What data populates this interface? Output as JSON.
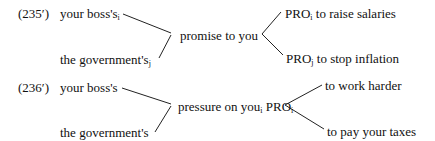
{
  "examples": [
    {
      "label": "(235′)",
      "left": [
        {
          "text": "your boss's",
          "sub": "i"
        },
        {
          "text": "the government's",
          "sub": "j"
        }
      ],
      "center": {
        "text": "promise to you",
        "sub": ""
      },
      "right": [
        {
          "pro": "PRO",
          "sub": "i",
          "text": " to raise salaries"
        },
        {
          "pro": "PRO",
          "sub": "j",
          "text": " to stop inflation"
        }
      ]
    },
    {
      "label": "(236′)",
      "left": [
        {
          "text": "your boss's",
          "sub": ""
        },
        {
          "text": "the government's",
          "sub": ""
        }
      ],
      "center": {
        "text": "pressure on you",
        "sub": "i",
        "pro": " PRO",
        "pro_sub": "i"
      },
      "right": [
        {
          "text": "to work harder"
        },
        {
          "text": "to pay your taxes"
        }
      ]
    }
  ]
}
